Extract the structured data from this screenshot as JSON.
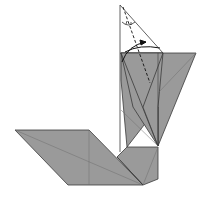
{
  "diagram": {
    "type": "origami-fold-diagram",
    "colors": {
      "paper_colored": "#9a9a9a",
      "paper_white": "#ffffff",
      "edge": "#3a3a3a",
      "crease": "#6e6e6e",
      "arrow": "#111111"
    },
    "symbols": [
      "valley-fold-line",
      "fold-arrow",
      "angle-bisect-marks"
    ]
  }
}
